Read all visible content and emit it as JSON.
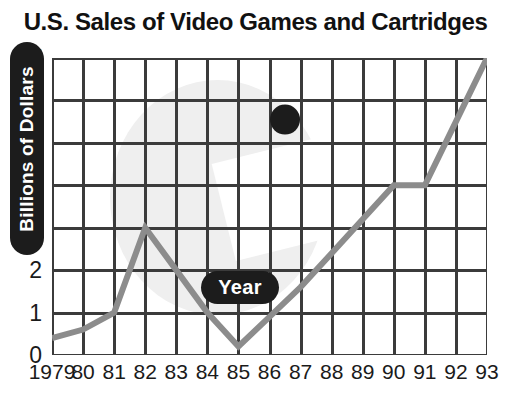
{
  "chart_data": {
    "type": "line",
    "title": "U.S. Sales of Video Games and Cartridges",
    "xlabel": "Year",
    "ylabel": "Billions of Dollars",
    "grid": true,
    "legend": "none",
    "xlim": [
      1979,
      1993
    ],
    "ylim": [
      0,
      7
    ],
    "y_ticks": [
      0,
      1,
      2,
      3,
      4,
      5,
      6,
      7
    ],
    "y_tick_labels": [
      "0",
      "1",
      "2",
      "3",
      "4",
      "5",
      "6",
      "7"
    ],
    "x_ticks": [
      1979,
      1980,
      1981,
      1982,
      1983,
      1984,
      1985,
      1986,
      1987,
      1988,
      1989,
      1990,
      1991,
      1992,
      1993
    ],
    "x_tick_labels": [
      "1979",
      "80",
      "81",
      "82",
      "83",
      "84",
      "85",
      "86",
      "87",
      "88",
      "89",
      "90",
      "91",
      "92",
      "93"
    ],
    "series": [
      {
        "name": "U.S. Sales",
        "color": "#8c8c8c",
        "x": [
          1979,
          1980,
          1981,
          1982,
          1983,
          1984,
          1985,
          1986,
          1987,
          1988,
          1989,
          1990,
          1991,
          1992,
          1993
        ],
        "values": [
          0.4,
          0.6,
          1.0,
          3.0,
          2.0,
          1.0,
          0.2,
          0.9,
          1.6,
          2.4,
          3.2,
          4.0,
          4.0,
          5.5,
          7.0
        ]
      }
    ],
    "annotations": [
      {
        "name": "point-marker",
        "shape": "filled-circle",
        "color": "#1c1c1c",
        "x": 1986.5,
        "y": 5.55
      }
    ]
  },
  "axes": {
    "y_pill_label": "Billions of Dollars",
    "x_pill_label": "Year"
  },
  "colors": {
    "line": "#8c8c8c",
    "grid": "#3b3b3b",
    "marker": "#1c1c1c",
    "text": "#1a1a1a",
    "background": "#ffffff",
    "watermark": "#efefef"
  }
}
